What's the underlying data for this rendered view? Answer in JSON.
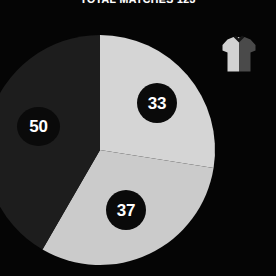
{
  "title": "TOTAL MATCHES 123",
  "background_color": "#050505",
  "icons": {
    "jersey": {
      "name": "jersey-icon",
      "light_color": "#d2d2d2",
      "dark_color": "#4a4a4a",
      "collar_color": "#151515"
    }
  },
  "chart_data": {
    "type": "pie",
    "title": "TOTAL MATCHES 123",
    "total": 120,
    "xlabel": "",
    "ylabel": "",
    "legend": "none",
    "grid": false,
    "start_angle_deg": 0,
    "direction": "clockwise",
    "center": [
      100,
      150
    ],
    "radius": 115,
    "categories": [
      "33",
      "37",
      "50"
    ],
    "values": [
      33,
      37,
      50
    ],
    "slices": [
      {
        "label": "33",
        "value": 33,
        "color": "#d5d5d5",
        "label_color": "#ffffff",
        "bubble_color": "#0a0a0a",
        "start_deg": 0,
        "end_deg": 99
      },
      {
        "label": "37",
        "value": 37,
        "color": "#cbcbcb",
        "label_color": "#ffffff",
        "bubble_color": "#0a0a0a",
        "start_deg": 99,
        "end_deg": 210
      },
      {
        "label": "50",
        "value": 50,
        "color": "#1d1d1d",
        "label_color": "#ffffff",
        "bubble_color": "#0a0a0a",
        "start_deg": 210,
        "end_deg": 360
      }
    ]
  }
}
